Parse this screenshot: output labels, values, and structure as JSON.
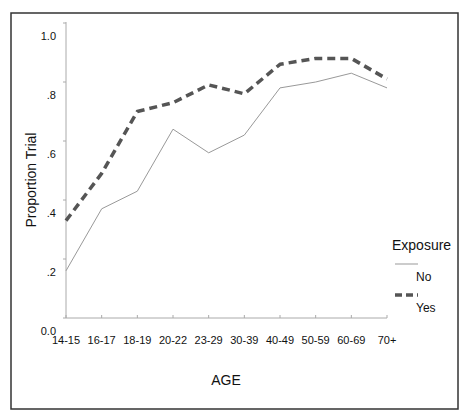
{
  "chart_data": {
    "type": "line",
    "title": "",
    "xlabel": "AGE",
    "ylabel": "Proportion Trial",
    "categories": [
      "14-15",
      "16-17",
      "18-19",
      "20-22",
      "23-29",
      "30-39",
      "40-49",
      "50-59",
      "60-69",
      "70+"
    ],
    "ylim": [
      0,
      1.0
    ],
    "yticks": [
      0.0,
      0.2,
      0.4,
      0.6,
      0.8,
      1.0
    ],
    "ytick_labels": [
      "0.0",
      ".2",
      ".4",
      ".6",
      ".8",
      "1.0"
    ],
    "grid": false,
    "legend": {
      "title": "Exposure",
      "placement": "right",
      "entries": [
        "No",
        "Yes"
      ]
    },
    "series": [
      {
        "name": "No",
        "style": "thin-solid",
        "color": "#999999",
        "values": [
          0.16,
          0.37,
          0.43,
          0.64,
          0.56,
          0.62,
          0.78,
          0.8,
          0.83,
          0.78
        ]
      },
      {
        "name": "Yes",
        "style": "thick-dashed",
        "color": "#555555",
        "values": [
          0.33,
          0.49,
          0.7,
          0.73,
          0.79,
          0.76,
          0.86,
          0.88,
          0.88,
          0.81
        ]
      }
    ]
  }
}
